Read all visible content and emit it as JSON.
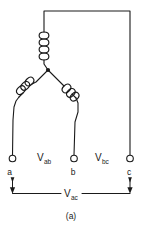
{
  "figure": {
    "caption": "(a)",
    "type": "wye-connected three-phase source schematic"
  },
  "colors": {
    "background": "#ffffff",
    "wire": "#1a1a1a",
    "text": "#1a1a1a"
  },
  "terminals": [
    {
      "id": "a",
      "label": "a",
      "x": 12,
      "y": 160
    },
    {
      "id": "b",
      "label": "b",
      "x": 74,
      "y": 160
    },
    {
      "id": "c",
      "label": "c",
      "x": 130,
      "y": 160
    }
  ],
  "voltage_labels": [
    {
      "id": "vab",
      "symbol": "V",
      "subscript": "ab",
      "x": 40,
      "y": 157
    },
    {
      "id": "vbc",
      "symbol": "V",
      "subscript": "bc",
      "x": 98,
      "y": 157
    },
    {
      "id": "vac",
      "symbol": "V",
      "subscript": "ac",
      "x": 69,
      "y": 196
    }
  ],
  "coils": [
    {
      "id": "coil-top",
      "turns": 4,
      "orientation": "vertical"
    },
    {
      "id": "coil-left",
      "turns": 3,
      "orientation": "diagonal-left"
    },
    {
      "id": "coil-right",
      "turns": 3,
      "orientation": "diagonal-right"
    }
  ],
  "nodes": [
    {
      "id": "neutral",
      "label": "",
      "x": 48,
      "y": 70
    }
  ]
}
